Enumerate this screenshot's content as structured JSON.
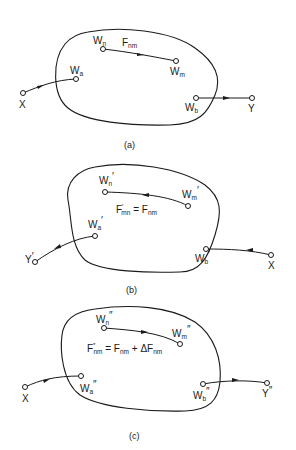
{
  "panels": [
    {
      "caption": "(a)",
      "nodes": {
        "wn": {
          "base": "W",
          "sub": "n",
          "prime": ""
        },
        "wm": {
          "base": "W",
          "sub": "m",
          "prime": ""
        },
        "wa": {
          "base": "W",
          "sub": "a",
          "prime": ""
        },
        "wb": {
          "base": "W",
          "sub": "b",
          "prime": ""
        },
        "x": {
          "base": "X",
          "prime": ""
        },
        "y": {
          "base": "Y",
          "prime": ""
        }
      },
      "edge_label": {
        "base": "F",
        "sub": "nm"
      }
    },
    {
      "caption": "(b)",
      "nodes": {
        "wn": {
          "base": "W",
          "sub": "n",
          "prime": "′"
        },
        "wm": {
          "base": "W",
          "sub": "m",
          "prime": "′"
        },
        "wa": {
          "base": "W",
          "sub": "a",
          "prime": "′"
        },
        "wb": {
          "base": "W",
          "sub": "b",
          "prime": "′"
        },
        "x": {
          "base": "X",
          "prime": ""
        },
        "y": {
          "base": "Y",
          "prime": "′"
        }
      },
      "equation": {
        "lhs": "F",
        "lhs_prime": "′",
        "lhs_sub": "mn",
        "eq": " = ",
        "rhs": "F",
        "rhs_sub": "nm"
      }
    },
    {
      "caption": "(c)",
      "nodes": {
        "wn": {
          "base": "W",
          "sub": "n",
          "prime": "″"
        },
        "wm": {
          "base": "W",
          "sub": "m",
          "prime": "″"
        },
        "wa": {
          "base": "W",
          "sub": "a",
          "prime": "″"
        },
        "wb": {
          "base": "W",
          "sub": "b",
          "prime": "″"
        },
        "x": {
          "base": "X",
          "prime": ""
        },
        "y": {
          "base": "Y",
          "prime": "″"
        }
      },
      "equation": {
        "lhs": "F",
        "lhs_prime": "″",
        "lhs_sub": "nm",
        "eq": " = ",
        "rhs": "F",
        "rhs_sub": "nm",
        "plus": " + ΔF",
        "delta_sub": "nm"
      }
    }
  ]
}
